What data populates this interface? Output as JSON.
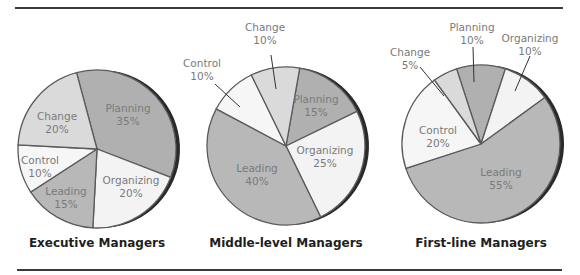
{
  "figure": {
    "colors": {
      "dark": "#a9a9a9",
      "medium": "#c9c9c9",
      "light": "#ececec",
      "lightest": "#f6f6f6",
      "stroke": "#5a5a5a",
      "label": "#7a7a7a",
      "title": "#1e1e1e"
    }
  },
  "chart_data": [
    {
      "type": "pie",
      "title": "Executive Managers",
      "slices": [
        {
          "label": "Planning",
          "value": 35
        },
        {
          "label": "Organizing",
          "value": 20
        },
        {
          "label": "Leading",
          "value": 15
        },
        {
          "label": "Control",
          "value": 10
        },
        {
          "label": "Change",
          "value": 20
        }
      ]
    },
    {
      "type": "pie",
      "title": "Middle-level Managers",
      "slices": [
        {
          "label": "Planning",
          "value": 15
        },
        {
          "label": "Organizing",
          "value": 25
        },
        {
          "label": "Leading",
          "value": 40
        },
        {
          "label": "Control",
          "value": 10
        },
        {
          "label": "Change",
          "value": 10
        }
      ]
    },
    {
      "type": "pie",
      "title": "First-line Managers",
      "slices": [
        {
          "label": "Planning",
          "value": 10
        },
        {
          "label": "Organizing",
          "value": 10
        },
        {
          "label": "Leading",
          "value": 55
        },
        {
          "label": "Control",
          "value": 20
        },
        {
          "label": "Change",
          "value": 5
        }
      ]
    }
  ],
  "layout": [
    {
      "cx": 97,
      "cy": 149,
      "r": 79,
      "start": -15,
      "fills": [
        "#b0b0b0",
        "#f3f3f3",
        "#b8b8b8",
        "#f6f6f6",
        "#dadada"
      ],
      "labels": [
        {
          "x": 128,
          "y": 112,
          "anchor": "middle"
        },
        {
          "x": 131,
          "y": 184,
          "anchor": "middle"
        },
        {
          "x": 66,
          "y": 195,
          "anchor": "middle"
        },
        {
          "x": 40,
          "y": 164,
          "anchor": "middle"
        },
        {
          "x": 57,
          "y": 120,
          "anchor": "middle"
        }
      ],
      "leaders": [],
      "title_x": 97,
      "title_y": 236
    },
    {
      "cx": 286,
      "cy": 146,
      "r": 79,
      "start": 10,
      "fills": [
        "#b0b0b0",
        "#f3f3f3",
        "#b8b8b8",
        "#f6f6f6",
        "#dadada"
      ],
      "labels": [
        {
          "x": 316,
          "y": 103,
          "anchor": "middle"
        },
        {
          "x": 325,
          "y": 154,
          "anchor": "middle"
        },
        {
          "x": 257,
          "y": 172,
          "anchor": "middle"
        },
        {
          "x": 202,
          "y": 67,
          "anchor": "middle"
        },
        {
          "x": 265,
          "y": 31,
          "anchor": "middle"
        }
      ],
      "leaders": [
        {
          "x1": 215,
          "y1": 84,
          "x2": 240,
          "y2": 107
        },
        {
          "x1": 271,
          "y1": 55,
          "x2": 276,
          "y2": 89
        }
      ],
      "title_x": 286,
      "title_y": 236
    },
    {
      "cx": 481,
      "cy": 144,
      "r": 79,
      "start": -18,
      "fills": [
        "#b0b0b0",
        "#f3f3f3",
        "#b8b8b8",
        "#f6f6f6",
        "#dadada"
      ],
      "labels": [
        {
          "x": 472,
          "y": 31,
          "anchor": "middle"
        },
        {
          "x": 530,
          "y": 42,
          "anchor": "middle"
        },
        {
          "x": 501,
          "y": 176,
          "anchor": "middle"
        },
        {
          "x": 438,
          "y": 134,
          "anchor": "middle"
        },
        {
          "x": 410,
          "y": 56,
          "anchor": "middle"
        }
      ],
      "leaders": [
        {
          "x1": 473,
          "y1": 47,
          "x2": 474,
          "y2": 82
        },
        {
          "x1": 530,
          "y1": 56,
          "x2": 515,
          "y2": 91
        },
        {
          "x1": 420,
          "y1": 67,
          "x2": 444,
          "y2": 96
        }
      ],
      "title_x": 481,
      "title_y": 236
    }
  ]
}
